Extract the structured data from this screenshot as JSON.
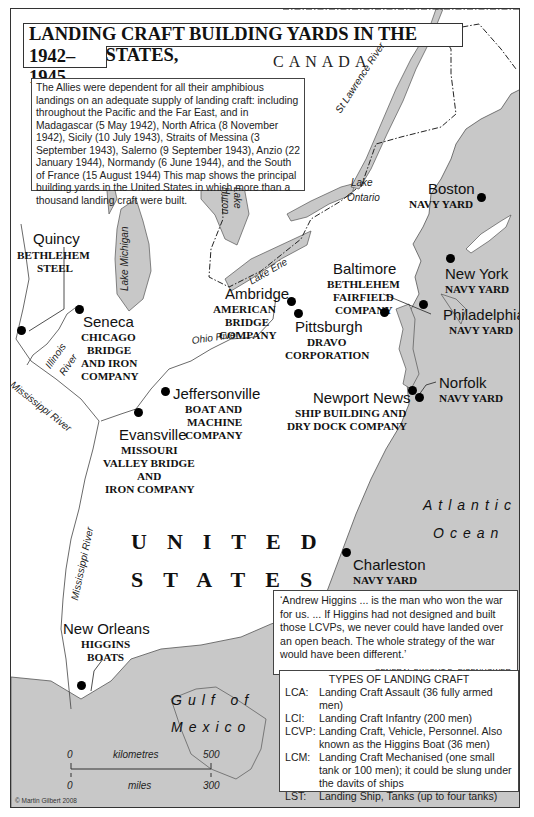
{
  "title": {
    "line1": "LANDING CRAFT BUILDING YARDS IN THE UNITED STATES,",
    "line2": "1942–1945"
  },
  "intro": {
    "text": "The Allies were dependent for all their amphibious landings on an adequate supply of landing craft: including throughout the Pacific and the Far East, and in Madagascar (5 May 1942), North Africa (8 November 1942), Sicily (10 July 1943), Straits of Messina (3 September 1943), Salerno (9 September 1943), Anzio (22 January 1944), Normandy (6 June 1944), and the South of France (15 August 1944) This map shows the principal building yards in the United States in which more than a thousand landing craft were built."
  },
  "regions": {
    "canada": "CANADA",
    "us_line1": "UNITED",
    "us_line2": "STATES",
    "atlantic_line1": "Atlantic",
    "atlantic_line2": "Ocean",
    "gulf_line1": "Gulf of",
    "gulf_line2": "Mexico"
  },
  "water_features": {
    "st_lawrence": "St Lawrence River",
    "lake_ontario_1": "Lake",
    "lake_ontario_2": "Ontario",
    "lake_michigan": "Lake Michigan",
    "lake_huron_1": "Lake",
    "lake_huron_2": "Huron",
    "lake_erie": "Lake Erie",
    "illinois_1": "Illinois",
    "illinois_2": "River",
    "ohio": "Ohio River",
    "mississippi_upper": "Mississippi River",
    "mississippi_lower": "Mississippi River"
  },
  "yards": [
    {
      "city": "Boston",
      "company": [
        "NAVY YARD"
      ]
    },
    {
      "city": "Quincy",
      "company": [
        "BETHLEHEM",
        "STEEL"
      ]
    },
    {
      "city": "Baltimore",
      "company": [
        "BETHLEHEM",
        "FAIRFIELD",
        "COMPANY"
      ]
    },
    {
      "city": "New York",
      "company": [
        "NAVY YARD"
      ]
    },
    {
      "city": "Ambridge",
      "company": [
        "AMERICAN",
        "BRIDGE",
        "COMPANY"
      ]
    },
    {
      "city": "Pittsburgh",
      "company": [
        "DRAVO",
        "CORPORATION"
      ]
    },
    {
      "city": "Philadelphia",
      "company": [
        "NAVY YARD"
      ]
    },
    {
      "city": "Seneca",
      "company": [
        "CHICAGO",
        "BRIDGE",
        "AND IRON",
        "COMPANY"
      ]
    },
    {
      "city": "Jeffersonville",
      "company": [
        "BOAT AND",
        "MACHINE",
        "COMPANY"
      ]
    },
    {
      "city": "Newport News",
      "company": [
        "SHIP BUILDING AND",
        "DRY DOCK COMPANY"
      ]
    },
    {
      "city": "Norfolk",
      "company": [
        "NAVY YARD"
      ]
    },
    {
      "city": "Evansville",
      "company": [
        "MISSOURI",
        "VALLEY BRIDGE",
        "AND",
        "IRON COMPANY"
      ]
    },
    {
      "city": "Charleston",
      "company": [
        "NAVY YARD"
      ]
    },
    {
      "city": "New Orleans",
      "company": [
        "HIGGINS",
        "BOATS"
      ]
    }
  ],
  "quote": {
    "text": "‘Andrew Higgins ... is the man who won the war for us. ... If Higgins had not designed and built those LCVPs, we never could have landed over an open beach. The whole strategy of the war would have been different.’",
    "attribution": "GENERAL DWIGHT D. EISENHOWER"
  },
  "landing_craft_types": {
    "title": "TYPES OF LANDING CRAFT",
    "items": [
      {
        "abbr": "LCA:",
        "desc": "Landing Craft Assault (36 fully armed men)"
      },
      {
        "abbr": "LCI:",
        "desc": "Landing Craft Infantry (200 men)"
      },
      {
        "abbr": "LCVP:",
        "desc": "Landing Craft, Vehicle, Personnel. Also known as the Higgins Boat (36 men)"
      },
      {
        "abbr": "LCM:",
        "desc": "Landing Craft Mechanised (one small tank or 100 men); it could be slung under the davits of ships"
      },
      {
        "abbr": "LST:",
        "desc": "Landing Ship, Tanks (up to four tanks)"
      }
    ]
  },
  "scale": {
    "km_start": "0",
    "km_label": "kilometres",
    "km_end": "500",
    "mi_start": "0",
    "mi_label": "miles",
    "mi_end": "300"
  },
  "copyright": "© Martin Gilbert 2008",
  "colors": {
    "water": "#c8c8c8",
    "land": "#ffffff",
    "ink": "#111111"
  }
}
